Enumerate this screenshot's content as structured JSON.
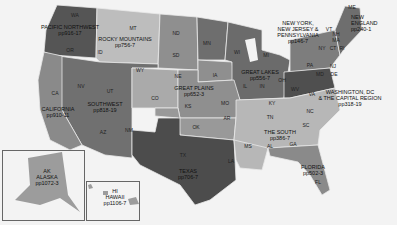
{
  "map": {
    "title": "US regions map",
    "colors": {
      "background": "#f3f3f3",
      "dark": "#5a5a5a",
      "mid_dark": "#7a7a7a",
      "mid": "#8e8e8e",
      "light": "#b5b5b5",
      "lighter": "#c7c7c7",
      "border": "#e8e8e8"
    },
    "regions": [
      {
        "name": "PACIFIC NORTHWEST",
        "pages": "pp916-17"
      },
      {
        "name": "ROCKY MOUNTAINS",
        "pages": "pp756-7"
      },
      {
        "name": "CALIFORNIA",
        "pages": "pp910-11"
      },
      {
        "name": "SOUTHWEST",
        "pages": "pp818-19"
      },
      {
        "name": "GREAT PLAINS",
        "pages": "pp652-3"
      },
      {
        "name": "GREAT LAKES",
        "pages": "pp556-7"
      },
      {
        "name": "NEW YORK, NEW JERSEY & PENNSYLVANIA",
        "line1": "NEW YORK,",
        "line2": "NEW JERSEY &",
        "line3": "PENNSYLVANIA",
        "pages": "pp146-7"
      },
      {
        "name": "NEW ENGLAND",
        "line1": "NEW",
        "line2": "ENGLAND",
        "pages": "pp240-1"
      },
      {
        "name": "WASHINGTON, DC & THE CAPITAL REGION",
        "line1": "WASHINGTON, DC",
        "line2": "& THE CAPITAL REGION",
        "pages": "pp318-19"
      },
      {
        "name": "THE SOUTH",
        "pages": "pp386-7"
      },
      {
        "name": "TEXAS",
        "pages": "pp706-7"
      },
      {
        "name": "FLORIDA",
        "pages": "pp502-3"
      },
      {
        "name": "ALASKA",
        "abbr": "AK",
        "pages": "pp1072-3"
      },
      {
        "name": "HAWAII",
        "abbr": "HI",
        "pages": "pp1106-7"
      }
    ],
    "states": [
      "WA",
      "OR",
      "ID",
      "MT",
      "WY",
      "ND",
      "SD",
      "NE",
      "MN",
      "WI",
      "MI",
      "IA",
      "IL",
      "IN",
      "OH",
      "NY",
      "PA",
      "ME",
      "VT",
      "NH",
      "MA",
      "CT",
      "RI",
      "NJ",
      "DE",
      "MD",
      "WV",
      "VA",
      "KY",
      "TN",
      "NC",
      "SC",
      "GA",
      "AL",
      "MS",
      "LA",
      "AR",
      "MO",
      "KS",
      "OK",
      "TX",
      "NM",
      "AZ",
      "UT",
      "NV",
      "CA",
      "CO",
      "FL"
    ]
  }
}
